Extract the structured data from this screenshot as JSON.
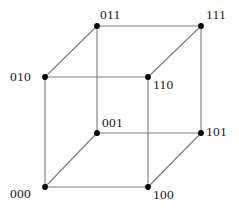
{
  "figure": {
    "width": 239,
    "height": 210,
    "background_color": "#ffffff",
    "edge_color": "#7a7a7a",
    "vertex_color": "#000000",
    "label_color": "#1a1a1a"
  },
  "chart_data": {
    "type": "diagram",
    "title": "",
    "xlabel": "",
    "ylabel": "",
    "vertices": [
      {
        "id": "v000",
        "label": "000",
        "x": 45,
        "y": 187,
        "label_x": 10,
        "label_y": 187
      },
      {
        "id": "v100",
        "label": "100",
        "x": 148,
        "y": 187,
        "label_x": 153,
        "label_y": 188
      },
      {
        "id": "v001",
        "label": "001",
        "x": 97,
        "y": 133,
        "label_x": 102,
        "label_y": 116
      },
      {
        "id": "v101",
        "label": "101",
        "x": 201,
        "y": 133,
        "label_x": 206,
        "label_y": 125
      },
      {
        "id": "v010",
        "label": "010",
        "x": 45,
        "y": 77,
        "label_x": 10,
        "label_y": 70
      },
      {
        "id": "v110",
        "label": "110",
        "x": 148,
        "y": 77,
        "label_x": 153,
        "label_y": 78
      },
      {
        "id": "v011",
        "label": "011",
        "x": 97,
        "y": 26,
        "label_x": 100,
        "label_y": 8
      },
      {
        "id": "v111",
        "label": "111",
        "x": 201,
        "y": 26,
        "label_x": 206,
        "label_y": 8
      }
    ],
    "edges": [
      {
        "from": "v000",
        "to": "v100"
      },
      {
        "from": "v000",
        "to": "v010"
      },
      {
        "from": "v000",
        "to": "v001"
      },
      {
        "from": "v100",
        "to": "v110"
      },
      {
        "from": "v100",
        "to": "v101"
      },
      {
        "from": "v010",
        "to": "v110"
      },
      {
        "from": "v010",
        "to": "v011"
      },
      {
        "from": "v001",
        "to": "v101"
      },
      {
        "from": "v001",
        "to": "v011"
      },
      {
        "from": "v111",
        "to": "v011"
      },
      {
        "from": "v111",
        "to": "v110"
      },
      {
        "from": "v111",
        "to": "v101"
      }
    ]
  }
}
